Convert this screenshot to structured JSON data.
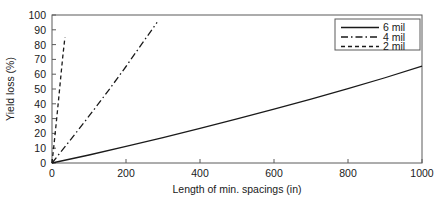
{
  "chart_data": {
    "type": "line",
    "title": "",
    "xlabel": "Length of min. spacings (in)",
    "ylabel": "Yield loss (%)",
    "xlim": [
      0,
      1000
    ],
    "ylim": [
      0,
      100
    ],
    "xticks": [
      0,
      200,
      400,
      600,
      800,
      1000
    ],
    "yticks": [
      0,
      10,
      20,
      30,
      40,
      50,
      60,
      70,
      80,
      90,
      100
    ],
    "xtick_labels": [
      "0",
      "200",
      "400",
      "600",
      "800",
      "1000"
    ],
    "ytick_labels": [
      "0",
      "10",
      "20",
      "30",
      "40",
      "50",
      "60",
      "70",
      "80",
      "90",
      "100"
    ],
    "grid": false,
    "frame": true,
    "legend_position": "upper right",
    "line_color": "#1a1a1a",
    "series": [
      {
        "name": "6 mil",
        "style": "solid",
        "x": [
          0,
          100,
          200,
          300,
          400,
          500,
          600,
          700,
          800,
          900,
          1000
        ],
        "values": [
          0,
          5.4,
          11.2,
          17.2,
          23.4,
          29.8,
          36.4,
          43.2,
          50.2,
          57.6,
          65.5
        ]
      },
      {
        "name": "4 mil",
        "style": "dash-dot",
        "x": [
          0,
          40,
          80,
          120,
          160,
          200,
          240,
          284
        ],
        "values": [
          0,
          12.5,
          25.2,
          38.2,
          51.5,
          65.2,
          79.5,
          95.0
        ]
      },
      {
        "name": "2 mil",
        "style": "dashed",
        "x": [
          0,
          5,
          10,
          15,
          20,
          25,
          30,
          35
        ],
        "values": [
          0,
          11.5,
          23.5,
          35.8,
          48.5,
          61.5,
          74.0,
          85.0
        ]
      }
    ],
    "legend_entries": [
      {
        "label": "6 mil",
        "style": "solid"
      },
      {
        "label": "4 mil",
        "style": "dash-dot"
      },
      {
        "label": "2 mil",
        "style": "dashed"
      }
    ]
  }
}
